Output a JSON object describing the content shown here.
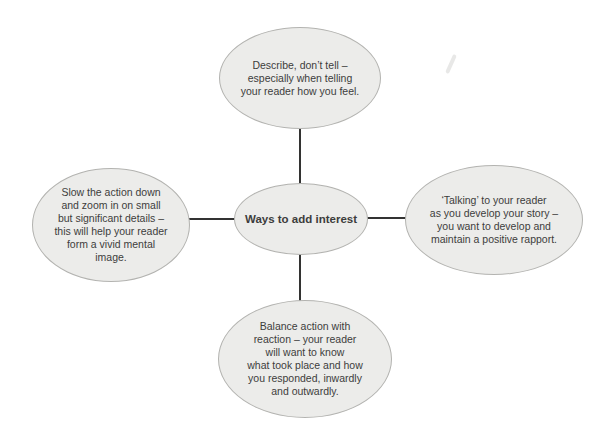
{
  "colors": {
    "background": "#ffffff",
    "node_fill": "#ececea",
    "node_border": "#b3b3b0",
    "connector": "#333332",
    "text": "#3d3d3c"
  },
  "center_node": {
    "label": "Ways to add interest"
  },
  "nodes": [
    {
      "id": "top",
      "text": "Describe, don’t tell –\nespecially when telling\nyour reader how you feel."
    },
    {
      "id": "left",
      "text": "Slow the action down\nand zoom in on small\nbut significant details –\nthis will help your reader\nform a vivid mental\nimage."
    },
    {
      "id": "right",
      "text": "‘Talking’ to your reader\nas you develop your story –\nyou want to develop and\nmaintain a positive rapport."
    },
    {
      "id": "bottom",
      "text": "Balance action with\nreaction – your reader\nwill want to know\nwhat took place and how\nyou responded, inwardly\nand outwardly."
    }
  ]
}
